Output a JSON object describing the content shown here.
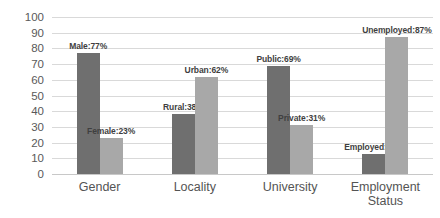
{
  "chart_data": {
    "type": "bar",
    "title": "",
    "subtitle": "",
    "xlabel": "",
    "ylabel": "",
    "ylim": [
      0,
      100
    ],
    "yticks": [
      100,
      90,
      80,
      70,
      60,
      50,
      40,
      30,
      20,
      10,
      0
    ],
    "grid": true,
    "legend": "none",
    "categories": [
      "Gender",
      "Locality",
      "University",
      "Employment\nStatus"
    ],
    "groups": [
      {
        "category": "Gender",
        "bars": [
          {
            "name": "Male",
            "value": 77,
            "label": "Male:77%",
            "color": "#6f6f6f",
            "series": "first"
          },
          {
            "name": "Female",
            "value": 23,
            "label": "Female:23%",
            "color": "#a8a8a8",
            "series": "second"
          }
        ]
      },
      {
        "category": "Locality",
        "bars": [
          {
            "name": "Rural",
            "value": 38,
            "label": "Rural:38%",
            "color": "#6f6f6f",
            "series": "first"
          },
          {
            "name": "Urban",
            "value": 62,
            "label": "Urban:62%",
            "color": "#a8a8a8",
            "series": "second"
          }
        ]
      },
      {
        "category": "University",
        "bars": [
          {
            "name": "Public",
            "value": 69,
            "label": "Public:69%",
            "color": "#6f6f6f",
            "series": "first"
          },
          {
            "name": "Private",
            "value": 31,
            "label": "Private:31%",
            "color": "#a8a8a8",
            "series": "second"
          }
        ]
      },
      {
        "category": "Employment Status",
        "bars": [
          {
            "name": "Employed",
            "value": 13,
            "label": "Employed:13%",
            "color": "#6f6f6f",
            "series": "first"
          },
          {
            "name": "Unemployed",
            "value": 87,
            "label": "Unemployed:87%",
            "color": "#a8a8a8",
            "series": "second"
          }
        ]
      }
    ],
    "colors": {
      "series_first": "#6f6f6f",
      "series_second": "#a8a8a8",
      "gridline": "#d9d9d9",
      "axis_text": "#595959",
      "category_text": "#545454",
      "data_label_text": "#3f3f3f",
      "background": "#ffffff"
    }
  }
}
